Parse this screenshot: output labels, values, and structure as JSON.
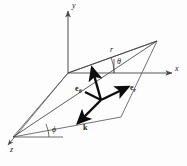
{
  "figure": {
    "type": "geometry-diagram",
    "axes": [
      {
        "name": "y-axis-label",
        "text": "y"
      },
      {
        "name": "x-axis-label",
        "text": "x"
      },
      {
        "name": "z-axis-label",
        "text": "z"
      }
    ],
    "labels": {
      "y_axis": "y",
      "x_axis": "x",
      "z_axis": "z",
      "radius": "r",
      "theta_angle": "θ",
      "phi_angle": "ϕ",
      "e_theta_base": "e",
      "e_theta_sub": "θ",
      "e_r_base": "e",
      "e_r_sub": "r",
      "k_vector": "k"
    },
    "caption": "",
    "colors": {
      "line": "#4a4a4a",
      "vector": "#0d0d0d",
      "text": "#1a1a1a",
      "background": "#fdfdfd"
    }
  }
}
